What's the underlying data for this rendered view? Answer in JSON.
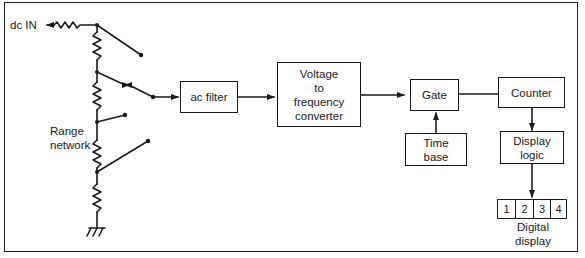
{
  "diagram": {
    "input_label": "dc IN",
    "range_label": [
      "Range",
      "network"
    ],
    "blocks": {
      "ac_filter": "ac filter",
      "vfc": [
        "Voltage",
        "to",
        "frequency",
        "converter"
      ],
      "gate": "Gate",
      "time_base": [
        "Time",
        "base"
      ],
      "counter": "Counter",
      "display_logic": [
        "Display",
        "logic"
      ]
    },
    "digital_display": {
      "digits": [
        "1",
        "2",
        "3",
        "4"
      ],
      "label": [
        "Digital",
        "display"
      ]
    },
    "connections": [
      {
        "from": "dc IN",
        "to": "Range network"
      },
      {
        "from": "Range network",
        "to": "ac filter"
      },
      {
        "from": "ac filter",
        "to": "Voltage to frequency converter"
      },
      {
        "from": "Voltage to frequency converter",
        "to": "Gate"
      },
      {
        "from": "Time base",
        "to": "Gate"
      },
      {
        "from": "Gate",
        "to": "Counter"
      },
      {
        "from": "Counter",
        "to": "Display logic"
      },
      {
        "from": "Display logic",
        "to": "Digital display"
      }
    ],
    "colors": {
      "line": "#1a1a1a",
      "background": "#ffffff"
    }
  }
}
